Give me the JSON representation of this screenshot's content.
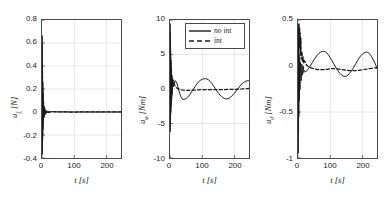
{
  "figure": {
    "panel_count": 3,
    "background": "#ffffff",
    "axis_color": "#4a4a4a",
    "grid_color": "#d8d8d8",
    "line_color": "#1a1a1a"
  },
  "legend": {
    "position": "top-center-of-middle-panel",
    "entries": [
      {
        "label": "no int",
        "style": "solid"
      },
      {
        "label": "int",
        "style": "dashed"
      }
    ]
  },
  "chart_data": [
    {
      "type": "line",
      "title": "",
      "xlabel": "t [s]",
      "ylabel": "u_xi [N]",
      "ylabel_base": "u",
      "ylabel_sub": "ξ",
      "ylabel_unit": "[N]",
      "xlim": [
        0,
        245
      ],
      "ylim": [
        -0.4,
        0.8
      ],
      "xticks": [
        0,
        100,
        200
      ],
      "xticklabels": [
        "0",
        "100",
        "200"
      ],
      "yticks": [
        0.8,
        0.6,
        0.4,
        0.2,
        0,
        -0.2,
        -0.4
      ],
      "yticklabels": [
        "0.8",
        "0.6",
        "0.4",
        "0.2",
        "0",
        "-0.2",
        "-0.4"
      ],
      "grid": true,
      "series": [
        {
          "name": "no int",
          "style": "solid",
          "x": [
            0,
            0.5,
            1,
            1.5,
            2,
            2.5,
            3,
            3.5,
            4,
            5,
            6,
            7,
            8,
            9,
            10,
            12,
            14,
            16,
            18,
            20,
            25,
            30,
            40,
            60,
            80,
            100,
            120,
            140,
            160,
            180,
            200,
            220,
            245
          ],
          "y": [
            0.0,
            0.66,
            -0.37,
            0.42,
            -0.24,
            0.26,
            -0.15,
            0.16,
            -0.09,
            0.09,
            -0.05,
            0.05,
            -0.03,
            0.03,
            -0.02,
            0.015,
            -0.01,
            0.01,
            -0.007,
            0.006,
            0.004,
            0.003,
            0.002,
            0.001,
            0.001,
            0.0,
            0.0,
            0.0,
            0.0,
            0.0,
            0.0,
            0.0,
            0.0
          ]
        },
        {
          "name": "int",
          "style": "dashed",
          "x": [
            0,
            0.5,
            1,
            1.5,
            2,
            2.5,
            3,
            4,
            5,
            7,
            10,
            15,
            20,
            30,
            50,
            80,
            120,
            160,
            200,
            245
          ],
          "y": [
            0.0,
            0.58,
            -0.33,
            0.35,
            -0.2,
            0.2,
            -0.12,
            0.08,
            -0.05,
            0.03,
            -0.015,
            0.008,
            -0.004,
            0.002,
            0.001,
            0.0,
            0.0,
            0.0,
            0.0,
            0.0
          ]
        }
      ]
    },
    {
      "type": "line",
      "title": "",
      "xlabel": "t [s]",
      "ylabel": "u_phi [Nm]",
      "ylabel_base": "u",
      "ylabel_sub": "φ",
      "ylabel_unit": "[Nm]",
      "xlim": [
        0,
        245
      ],
      "ylim": [
        -10,
        10
      ],
      "xticks": [
        0,
        100,
        200
      ],
      "xticklabels": [
        "0",
        "100",
        "200"
      ],
      "yticks": [
        10,
        5,
        0,
        -5,
        -10
      ],
      "yticklabels": [
        "10",
        "5",
        "0",
        "-5",
        "-10"
      ],
      "grid": true,
      "series": [
        {
          "name": "no int",
          "style": "solid",
          "x": [
            0,
            0.4,
            0.8,
            1.2,
            1.6,
            2.0,
            2.5,
            3.0,
            3.5,
            4.0,
            5,
            6,
            7,
            8,
            10,
            12,
            14,
            16,
            18,
            20,
            24,
            28,
            32,
            36,
            40,
            50,
            60,
            70,
            80,
            90,
            100,
            110,
            120,
            130,
            140,
            150,
            160,
            170,
            180,
            190,
            200,
            210,
            220,
            230,
            240,
            245
          ],
          "y": [
            0.0,
            9.4,
            -6.2,
            7.4,
            -4.6,
            5.6,
            -3.4,
            4.2,
            -2.4,
            3.0,
            -1.6,
            2.0,
            -0.8,
            1.3,
            0.3,
            1.1,
            0.8,
            1.2,
            1.1,
            1.0,
            0.4,
            -0.3,
            -0.9,
            -1.3,
            -1.5,
            -1.4,
            -0.9,
            -0.2,
            0.5,
            1.1,
            1.4,
            1.5,
            1.3,
            0.8,
            0.1,
            -0.6,
            -1.1,
            -1.4,
            -1.4,
            -1.1,
            -0.6,
            0.0,
            0.6,
            1.0,
            1.2,
            1.2
          ]
        },
        {
          "name": "int",
          "style": "dashed",
          "x": [
            0,
            0.4,
            0.8,
            1.2,
            1.6,
            2.0,
            2.5,
            3.0,
            3.5,
            4,
            5,
            6,
            8,
            10,
            12,
            14,
            16,
            18,
            20,
            25,
            30,
            40,
            50,
            60,
            80,
            100,
            120,
            140,
            160,
            180,
            200,
            220,
            240,
            245
          ],
          "y": [
            0.0,
            8.2,
            -5.4,
            6.2,
            -3.8,
            4.6,
            -2.8,
            3.4,
            -2.0,
            2.4,
            -1.2,
            1.6,
            1.2,
            1.3,
            0.9,
            0.6,
            0.4,
            0.3,
            0.2,
            0.05,
            -0.05,
            -0.15,
            -0.2,
            -0.2,
            -0.15,
            -0.1,
            -0.1,
            -0.1,
            -0.1,
            -0.05,
            -0.05,
            0.0,
            0.05,
            0.1
          ]
        }
      ]
    },
    {
      "type": "line",
      "title": "",
      "xlabel": "t [s]",
      "ylabel": "u_theta [Nm]",
      "ylabel_base": "u",
      "ylabel_sub": "ϑ",
      "ylabel_unit": "[Nm]",
      "xlim": [
        0,
        245
      ],
      "ylim": [
        -1,
        0.5
      ],
      "xticks": [
        0,
        100,
        200
      ],
      "xticklabels": [
        "0",
        "100",
        "200"
      ],
      "yticks": [
        0.5,
        0,
        -0.5,
        -1
      ],
      "yticklabels": [
        "0.5",
        "0",
        "-0.5",
        "-1"
      ],
      "grid": true,
      "series": [
        {
          "name": "no int",
          "style": "solid",
          "x": [
            0,
            0.4,
            0.8,
            1.2,
            1.6,
            2.0,
            2.5,
            3.0,
            4,
            5,
            6,
            8,
            10,
            12,
            14,
            16,
            18,
            20,
            24,
            28,
            32,
            40,
            50,
            60,
            70,
            80,
            90,
            100,
            110,
            120,
            130,
            140,
            150,
            160,
            170,
            180,
            190,
            200,
            210,
            220,
            230,
            240,
            245
          ],
          "y": [
            0.0,
            0.32,
            -0.95,
            0.22,
            -0.72,
            0.16,
            -0.55,
            0.12,
            -0.38,
            0.08,
            -0.26,
            0.04,
            -0.16,
            0.02,
            -0.1,
            0.0,
            -0.07,
            -0.05,
            -0.06,
            -0.05,
            -0.03,
            0.01,
            0.07,
            0.12,
            0.15,
            0.16,
            0.14,
            0.09,
            0.03,
            -0.03,
            -0.08,
            -0.11,
            -0.11,
            -0.08,
            -0.03,
            0.03,
            0.09,
            0.13,
            0.15,
            0.14,
            0.09,
            0.02,
            -0.03
          ]
        },
        {
          "name": "int",
          "style": "dashed",
          "x": [
            0,
            0.4,
            0.8,
            1.2,
            1.6,
            2.0,
            2.5,
            3.0,
            4,
            5,
            6,
            7,
            8,
            9,
            10,
            12,
            14,
            16,
            18,
            20,
            25,
            30,
            40,
            50,
            60,
            70,
            80,
            100,
            120,
            140,
            160,
            180,
            200,
            220,
            240,
            245
          ],
          "y": [
            0.0,
            0.28,
            -0.6,
            0.42,
            -0.35,
            0.46,
            -0.2,
            0.44,
            0.3,
            0.42,
            0.2,
            0.36,
            0.12,
            0.3,
            0.08,
            0.16,
            0.05,
            0.1,
            0.03,
            0.06,
            0.02,
            0.0,
            -0.02,
            -0.03,
            -0.04,
            -0.04,
            -0.04,
            -0.03,
            -0.03,
            -0.04,
            -0.05,
            -0.05,
            -0.04,
            -0.03,
            -0.02,
            -0.02
          ]
        }
      ]
    }
  ]
}
